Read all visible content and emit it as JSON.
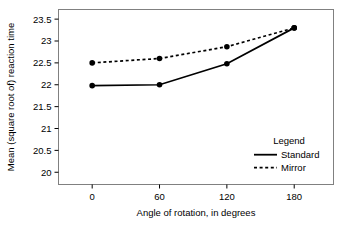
{
  "chart_data": {
    "type": "line",
    "title": "",
    "xlabel": "Angle of rotation, in degrees",
    "ylabel": "Mean (square root of) reaction time",
    "x": [
      0,
      60,
      120,
      180
    ],
    "xticklabels": [
      "0",
      "60",
      "120",
      "180"
    ],
    "yticklabels": [
      "20",
      "20.5",
      "21",
      "21.5",
      "22",
      "22.5",
      "23",
      "23.5"
    ],
    "yticks": [
      20,
      20.5,
      21,
      21.5,
      22,
      22.5,
      23,
      23.5
    ],
    "xlim": [
      -30,
      215
    ],
    "ylim": [
      19.72,
      23.72
    ],
    "grid": false,
    "legend": {
      "title": "Legend",
      "position": "inside-lower-right",
      "entries": [
        {
          "name": "Standard",
          "style": "solid",
          "color": "#000000"
        },
        {
          "name": "Mirror",
          "style": "dashed",
          "color": "#000000"
        }
      ]
    },
    "series": [
      {
        "name": "Standard",
        "style": "solid",
        "color": "#000000",
        "marker": "filled-circle",
        "values": [
          21.98,
          22.0,
          22.48,
          23.3
        ]
      },
      {
        "name": "Mirror",
        "style": "dashed",
        "color": "#000000",
        "marker": "filled-circle",
        "values": [
          22.5,
          22.6,
          22.87,
          23.3
        ]
      }
    ]
  },
  "figure": {
    "frame_color": "#808080",
    "background": "#ffffff"
  }
}
